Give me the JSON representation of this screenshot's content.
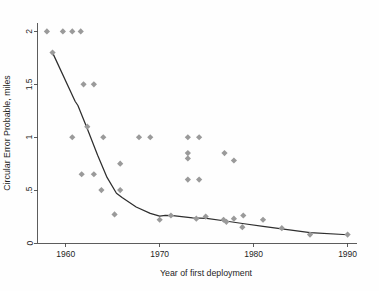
{
  "chart_data": {
    "type": "scatter",
    "title": "",
    "subtitle": "",
    "xlabel": "Year of first deployment",
    "ylabel": "Circular Error Probable, miles",
    "xlim": [
      1957.0,
      1991.0
    ],
    "ylim": [
      0,
      2.08
    ],
    "xticks": [
      1960,
      1970,
      1980,
      1990
    ],
    "xtick_labels": [
      "1960",
      "1970",
      "1980",
      "1990"
    ],
    "yticks": [
      0,
      0.5,
      1,
      1.5,
      2
    ],
    "ytick_labels": [
      "0",
      ".5",
      "1",
      "1.5",
      "2"
    ],
    "grid": false,
    "legend": null,
    "marker_style": "diamond",
    "marker_color": "#9a9a9a",
    "line_color": "#2e2e2e",
    "axis_color": "#4a4a4a",
    "background_color": "#fefefe",
    "series": [
      {
        "name": "Circular Error Probable by year of first deployment",
        "type": "scatter",
        "points": [
          {
            "x": 1958.0,
            "y": 2.0
          },
          {
            "x": 1959.7,
            "y": 2.0
          },
          {
            "x": 1960.7,
            "y": 2.0
          },
          {
            "x": 1961.6,
            "y": 2.0
          },
          {
            "x": 1958.6,
            "y": 1.8
          },
          {
            "x": 1961.9,
            "y": 1.5
          },
          {
            "x": 1963.0,
            "y": 1.5
          },
          {
            "x": 1962.3,
            "y": 1.1
          },
          {
            "x": 1960.7,
            "y": 1.0
          },
          {
            "x": 1964.0,
            "y": 1.0
          },
          {
            "x": 1967.8,
            "y": 1.0
          },
          {
            "x": 1969.0,
            "y": 1.0
          },
          {
            "x": 1973.0,
            "y": 1.0
          },
          {
            "x": 1974.2,
            "y": 1.0
          },
          {
            "x": 1973.0,
            "y": 0.85
          },
          {
            "x": 1973.0,
            "y": 0.8
          },
          {
            "x": 1976.9,
            "y": 0.85
          },
          {
            "x": 1977.9,
            "y": 0.78
          },
          {
            "x": 1965.8,
            "y": 0.75
          },
          {
            "x": 1961.7,
            "y": 0.65
          },
          {
            "x": 1963.0,
            "y": 0.65
          },
          {
            "x": 1973.0,
            "y": 0.6
          },
          {
            "x": 1974.2,
            "y": 0.6
          },
          {
            "x": 1963.8,
            "y": 0.5
          },
          {
            "x": 1965.8,
            "y": 0.5
          },
          {
            "x": 1965.2,
            "y": 0.27
          },
          {
            "x": 1970.0,
            "y": 0.22
          },
          {
            "x": 1971.2,
            "y": 0.26
          },
          {
            "x": 1973.9,
            "y": 0.23
          },
          {
            "x": 1974.9,
            "y": 0.25
          },
          {
            "x": 1976.8,
            "y": 0.22
          },
          {
            "x": 1977.1,
            "y": 0.2
          },
          {
            "x": 1977.9,
            "y": 0.23
          },
          {
            "x": 1978.9,
            "y": 0.26
          },
          {
            "x": 1978.8,
            "y": 0.15
          },
          {
            "x": 1981.0,
            "y": 0.22
          },
          {
            "x": 1983.0,
            "y": 0.14
          },
          {
            "x": 1986.0,
            "y": 0.08
          },
          {
            "x": 1990.0,
            "y": 0.08
          }
        ]
      },
      {
        "name": "Trend line",
        "type": "line",
        "points": [
          {
            "x": 1958.6,
            "y": 1.8
          },
          {
            "x": 1961.0,
            "y": 1.34
          },
          {
            "x": 1961.3,
            "y": 1.3
          },
          {
            "x": 1962.3,
            "y": 1.08
          },
          {
            "x": 1963.4,
            "y": 0.83
          },
          {
            "x": 1964.4,
            "y": 0.62
          },
          {
            "x": 1965.4,
            "y": 0.47
          },
          {
            "x": 1966.0,
            "y": 0.43
          },
          {
            "x": 1967.5,
            "y": 0.34
          },
          {
            "x": 1969.0,
            "y": 0.28
          },
          {
            "x": 1970.0,
            "y": 0.255
          },
          {
            "x": 1970.6,
            "y": 0.262
          },
          {
            "x": 1971.4,
            "y": 0.259
          },
          {
            "x": 1973.5,
            "y": 0.238
          },
          {
            "x": 1975.0,
            "y": 0.232
          },
          {
            "x": 1977.0,
            "y": 0.208
          },
          {
            "x": 1979.0,
            "y": 0.182
          },
          {
            "x": 1981.0,
            "y": 0.158
          },
          {
            "x": 1983.0,
            "y": 0.133
          },
          {
            "x": 1986.0,
            "y": 0.098
          },
          {
            "x": 1990.0,
            "y": 0.078
          }
        ]
      }
    ]
  }
}
